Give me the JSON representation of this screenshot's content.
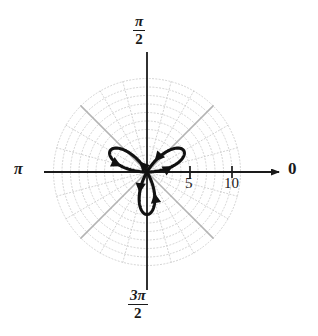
{
  "figure": {
    "kind": "polar-plot",
    "background_color": "#ffffff",
    "curve_color": "#111111",
    "axis_color": "#1a1a1a",
    "grid_color": "#c9c9c9",
    "grid_major_color": "#b0b0b0"
  },
  "axes": {
    "origin": {
      "x": 147,
      "y": 172
    },
    "pixels_per_unit": 8.5,
    "polar_angle_labels": {
      "right": "0",
      "top_numerator": "π",
      "top_denominator": "2",
      "left": "π",
      "bottom_numerator": "3π",
      "bottom_denominator": "2"
    },
    "radial_ticks": [
      {
        "label": "5",
        "value": 5,
        "x": 190
      },
      {
        "label": "10",
        "value": 10,
        "x": 232
      }
    ],
    "arrow_direction": "right"
  },
  "grid": {
    "max_radius_units": 11,
    "circle_radii_units": [
      1,
      2,
      3,
      4,
      5,
      6,
      7,
      8,
      9,
      10,
      11
    ],
    "radial_line_count": 24,
    "radial_spacing_degrees": 15,
    "major_radial_lines_degrees": [
      45,
      135,
      225,
      315
    ],
    "style": "dotted"
  },
  "chart_data": {
    "type": "line",
    "title": "",
    "subtitle": "",
    "xlabel": "",
    "ylabel": "",
    "coordinate_system": "polar",
    "equation": "r = 5 cos(3θ)",
    "petal_count": 3,
    "max_radius": 5,
    "petal_tip_angles_degrees": [
      30,
      150,
      270
    ],
    "petal_tips_pixels": [
      {
        "x": 200,
        "y": 140
      },
      {
        "x": 92,
        "y": 140
      },
      {
        "x": 147,
        "y": 231
      }
    ],
    "rlim": [
      0,
      11
    ],
    "theta_range_degrees": [
      0,
      360
    ],
    "grid": true,
    "legend": "none",
    "annotations": [
      {
        "name": "arrow-right-petal-outer",
        "note": "direction arrow on upper-right petal outgoing branch",
        "angle_degrees": 30
      },
      {
        "name": "arrow-right-petal-inner",
        "note": "direction arrow on upper-right petal returning branch",
        "angle_degrees": 10
      },
      {
        "name": "arrow-left-petal-outer",
        "note": "direction arrow on upper-left petal branch",
        "angle_degrees": 150
      },
      {
        "name": "arrow-left-petal-inner",
        "note": "direction arrow on upper-left petal returning branch",
        "angle_degrees": 170
      },
      {
        "name": "arrow-bottom-petal-left",
        "note": "downward direction arrow on lower petal",
        "angle_degrees": 255
      },
      {
        "name": "arrow-bottom-petal-right",
        "note": "upward direction arrow on lower petal",
        "angle_degrees": 285
      }
    ]
  }
}
